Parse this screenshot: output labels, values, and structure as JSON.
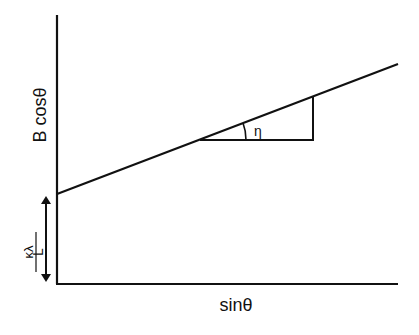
{
  "diagram": {
    "y_axis_label": "B cosθ",
    "x_axis_label": "sinθ",
    "intercept_label_numerator": "κλ",
    "intercept_label_denominator": "L",
    "angle_label": "η",
    "colors": {
      "line": "#111111",
      "background": "#ffffff"
    }
  }
}
